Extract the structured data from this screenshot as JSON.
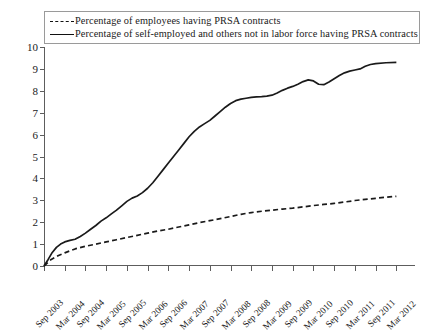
{
  "legend": {
    "position": "top",
    "bordered": true,
    "entries": [
      {
        "style": "dashed",
        "label": "Percentage of employees having PRSA contracts"
      },
      {
        "style": "solid",
        "label": "Percentage of self-employed and others not in labor force having PRSA contracts"
      }
    ]
  },
  "chart_data": {
    "type": "line",
    "title": "",
    "xlabel": "",
    "ylabel": "",
    "ylim": [
      0,
      10
    ],
    "ytick_labels": [
      "0",
      "1",
      "2",
      "3",
      "4",
      "5",
      "6",
      "7",
      "8",
      "9",
      "10"
    ],
    "grid": false,
    "legend_position": "top",
    "colors": {
      "line": "#1a1a1a",
      "axis": "#5d5d5d",
      "background": "#ffffff"
    },
    "categories": [
      "Sep 2003",
      "Mar 2004",
      "Sep 2004",
      "Mar 2005",
      "Sep 2005",
      "Mar 2006",
      "Sep 2006",
      "Mar 2007",
      "Sep 2007",
      "Mar 2008",
      "Sep 2008",
      "Mar 2009",
      "Sep 2009",
      "Mar 2010",
      "Sep 2010",
      "Mar 2011",
      "Sep 2011",
      "Mar 2012"
    ],
    "series": [
      {
        "name": "Percentage of employees having PRSA contracts",
        "style": "dashed",
        "values": [
          0.0,
          0.55,
          0.85,
          1.05,
          1.25,
          1.45,
          1.6,
          1.8,
          1.95,
          2.15,
          2.35,
          2.5,
          2.6,
          2.75,
          2.85,
          3.0,
          3.1,
          3.2
        ]
      },
      {
        "name": "Percentage of self-employed and others not in labor force having PRSA contracts",
        "style": "solid",
        "values": [
          0.0,
          1.1,
          1.25,
          1.9,
          2.5,
          3.1,
          4.0,
          5.0,
          6.0,
          6.85,
          7.4,
          7.7,
          7.75,
          8.1,
          8.45,
          8.25,
          8.9,
          9.3
        ]
      }
    ],
    "series_detail": [
      {
        "name": "Percentage of employees having PRSA contracts",
        "style": "dashed",
        "points": [
          [
            0,
            0.0
          ],
          [
            0.35,
            0.3
          ],
          [
            0.7,
            0.48
          ],
          [
            1,
            0.6
          ],
          [
            1.5,
            0.78
          ],
          [
            2,
            0.9
          ],
          [
            2.5,
            1.0
          ],
          [
            3,
            1.1
          ],
          [
            3.5,
            1.2
          ],
          [
            4,
            1.3
          ],
          [
            4.5,
            1.4
          ],
          [
            5,
            1.5
          ],
          [
            5.5,
            1.6
          ],
          [
            6,
            1.68
          ],
          [
            6.5,
            1.78
          ],
          [
            7,
            1.88
          ],
          [
            7.5,
            1.98
          ],
          [
            8,
            2.07
          ],
          [
            8.5,
            2.16
          ],
          [
            9,
            2.26
          ],
          [
            9.5,
            2.36
          ],
          [
            10,
            2.44
          ],
          [
            10.5,
            2.5
          ],
          [
            11,
            2.55
          ],
          [
            11.5,
            2.6
          ],
          [
            12,
            2.64
          ],
          [
            12.5,
            2.7
          ],
          [
            13,
            2.76
          ],
          [
            13.5,
            2.81
          ],
          [
            14,
            2.86
          ],
          [
            14.5,
            2.92
          ],
          [
            15,
            2.99
          ],
          [
            15.5,
            3.04
          ],
          [
            16,
            3.09
          ],
          [
            16.5,
            3.14
          ],
          [
            17,
            3.18
          ]
        ]
      },
      {
        "name": "Percentage of self-employed and others not in labor force having PRSA contracts",
        "style": "solid",
        "points": [
          [
            0,
            0.0
          ],
          [
            0.2,
            0.3
          ],
          [
            0.4,
            0.62
          ],
          [
            0.6,
            0.85
          ],
          [
            0.8,
            1.0
          ],
          [
            1,
            1.1
          ],
          [
            1.25,
            1.17
          ],
          [
            1.5,
            1.22
          ],
          [
            1.75,
            1.35
          ],
          [
            2,
            1.5
          ],
          [
            2.25,
            1.68
          ],
          [
            2.5,
            1.85
          ],
          [
            2.75,
            2.05
          ],
          [
            3,
            2.2
          ],
          [
            3.25,
            2.38
          ],
          [
            3.5,
            2.55
          ],
          [
            3.75,
            2.75
          ],
          [
            4,
            2.95
          ],
          [
            4.25,
            3.1
          ],
          [
            4.5,
            3.2
          ],
          [
            4.75,
            3.35
          ],
          [
            5,
            3.55
          ],
          [
            5.25,
            3.8
          ],
          [
            5.5,
            4.1
          ],
          [
            5.75,
            4.4
          ],
          [
            6,
            4.7
          ],
          [
            6.25,
            5.0
          ],
          [
            6.5,
            5.3
          ],
          [
            6.75,
            5.6
          ],
          [
            7,
            5.9
          ],
          [
            7.25,
            6.15
          ],
          [
            7.5,
            6.35
          ],
          [
            7.75,
            6.5
          ],
          [
            8,
            6.65
          ],
          [
            8.25,
            6.85
          ],
          [
            8.5,
            7.05
          ],
          [
            8.75,
            7.25
          ],
          [
            9,
            7.42
          ],
          [
            9.25,
            7.55
          ],
          [
            9.5,
            7.62
          ],
          [
            9.75,
            7.66
          ],
          [
            10,
            7.7
          ],
          [
            10.25,
            7.72
          ],
          [
            10.5,
            7.73
          ],
          [
            10.75,
            7.76
          ],
          [
            11,
            7.8
          ],
          [
            11.25,
            7.9
          ],
          [
            11.5,
            8.02
          ],
          [
            11.75,
            8.12
          ],
          [
            12,
            8.2
          ],
          [
            12.25,
            8.3
          ],
          [
            12.5,
            8.42
          ],
          [
            12.75,
            8.5
          ],
          [
            13,
            8.45
          ],
          [
            13.25,
            8.3
          ],
          [
            13.5,
            8.28
          ],
          [
            13.75,
            8.4
          ],
          [
            14,
            8.55
          ],
          [
            14.25,
            8.7
          ],
          [
            14.5,
            8.82
          ],
          [
            14.75,
            8.9
          ],
          [
            15,
            8.95
          ],
          [
            15.25,
            9.0
          ],
          [
            15.5,
            9.12
          ],
          [
            15.75,
            9.2
          ],
          [
            16,
            9.24
          ],
          [
            16.5,
            9.28
          ],
          [
            17,
            9.3
          ]
        ]
      }
    ]
  }
}
